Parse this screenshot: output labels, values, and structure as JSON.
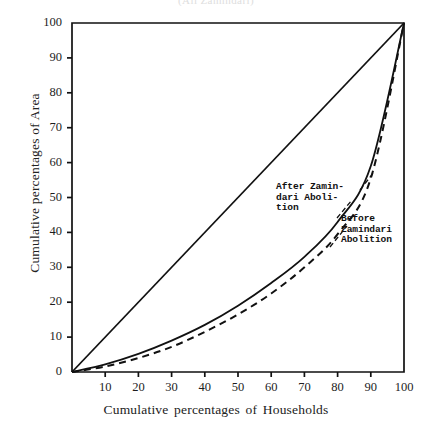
{
  "figure": {
    "top_sliver_text": "(All Zamindari)",
    "background_color": "#ffffff",
    "ink_color": "#111111"
  },
  "axes": {
    "xlabel": "Cumulative percentages of Households",
    "ylabel": "Cumulative percentages of Area",
    "xticks": [
      10,
      20,
      30,
      40,
      50,
      60,
      70,
      80,
      90,
      100
    ],
    "yticks": [
      0,
      10,
      20,
      30,
      40,
      50,
      60,
      70,
      80,
      90,
      100
    ],
    "xlim": [
      0,
      100
    ],
    "ylim": [
      0,
      100
    ]
  },
  "annotations": [
    {
      "name": "after-zamindari-abolition",
      "text": "After Zamin-\ndari Aboli-\ntion"
    },
    {
      "name": "before-zamindari-abolition",
      "text": "Before\nZamindari\nAbolition"
    }
  ],
  "chart_data": {
    "type": "line",
    "title": "",
    "subtitle": "",
    "xlabel": "Cumulative percentages of Households",
    "ylabel": "Cumulative percentages of Area",
    "xlim": [
      0,
      100
    ],
    "ylim": [
      0,
      100
    ],
    "grid": false,
    "legend_position": "inline-annotations",
    "x": [
      0,
      10,
      20,
      30,
      40,
      50,
      60,
      70,
      80,
      90,
      100
    ],
    "series": [
      {
        "name": "Line of equality",
        "style": "solid",
        "values": [
          0,
          10,
          20,
          30,
          40,
          50,
          60,
          70,
          80,
          90,
          100
        ]
      },
      {
        "name": "After Zamindari Abolition",
        "style": "solid",
        "values": [
          0,
          2.2,
          5.2,
          9.0,
          13.5,
          19.0,
          25.5,
          33.0,
          43.0,
          59.0,
          100
        ]
      },
      {
        "name": "Before Zamindari Abolition",
        "style": "dashed",
        "values": [
          0,
          1.6,
          4.0,
          7.2,
          11.5,
          16.5,
          22.5,
          30.0,
          39.5,
          55.5,
          100
        ]
      }
    ]
  }
}
